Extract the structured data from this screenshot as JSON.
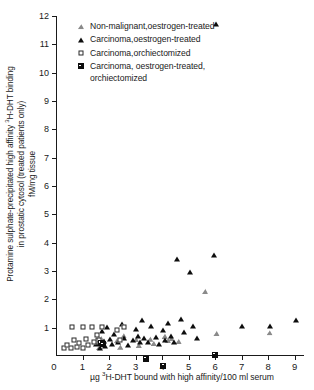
{
  "chart_data": {
    "type": "scatter",
    "title": "",
    "xlabel": "µg ³H-DHT bound with high affinity/100 ml serum",
    "ylabel_lines": [
      "Protamine sulphate-precipitated high affinity ³H-DHT binding",
      "in prostatic cytosol (treated patients only)",
      "fM/mg tissue"
    ],
    "xlim": [
      0,
      9.35
    ],
    "ylim": [
      0,
      12
    ],
    "xticks": [
      1,
      2,
      3,
      4,
      5,
      6,
      7,
      8,
      9
    ],
    "yticks": [
      1,
      2,
      3,
      4,
      5,
      6,
      7,
      8,
      9,
      10,
      11,
      12
    ],
    "origin_label": "0",
    "grid": false,
    "legend_position": "top-center",
    "series": [
      {
        "name": "Non-malignant, oestrogen-treated",
        "marker": "triangle-open",
        "color": "#8a8a8a",
        "points": [
          [
            1.55,
            0.5
          ],
          [
            1.62,
            0.3
          ],
          [
            1.7,
            0.62
          ],
          [
            1.78,
            0.4
          ],
          [
            2.3,
            0.55
          ],
          [
            2.42,
            0.32
          ],
          [
            2.55,
            0.72
          ],
          [
            3.02,
            0.58
          ],
          [
            3.12,
            0.38
          ],
          [
            3.55,
            0.6
          ],
          [
            3.68,
            0.45
          ],
          [
            4.1,
            0.7
          ],
          [
            4.22,
            0.55
          ],
          [
            4.35,
            0.62
          ],
          [
            4.62,
            0.52
          ],
          [
            5.62,
            2.28
          ],
          [
            6.05,
            0.8
          ],
          [
            8.05,
            0.82
          ]
        ]
      },
      {
        "name": "Carcinoma, oestrogen-treated",
        "marker": "triangle-filled",
        "color": "#0d0d0d",
        "points": [
          [
            1.52,
            0.42
          ],
          [
            1.6,
            0.68
          ],
          [
            1.66,
            0.3
          ],
          [
            1.72,
            0.88
          ],
          [
            1.8,
            0.52
          ],
          [
            1.86,
            0.35
          ],
          [
            1.92,
            1.02
          ],
          [
            2.02,
            0.6
          ],
          [
            2.12,
            0.44
          ],
          [
            2.2,
            0.78
          ],
          [
            2.35,
            0.48
          ],
          [
            2.48,
            1.12
          ],
          [
            2.58,
            0.62
          ],
          [
            2.72,
            0.4
          ],
          [
            2.92,
            0.55
          ],
          [
            3.0,
            0.95
          ],
          [
            3.08,
            0.72
          ],
          [
            3.16,
            0.48
          ],
          [
            3.24,
            1.28
          ],
          [
            3.32,
            0.62
          ],
          [
            3.45,
            0.5
          ],
          [
            3.58,
            1.05
          ],
          [
            3.78,
            0.68
          ],
          [
            3.88,
            0.42
          ],
          [
            4.02,
            0.92
          ],
          [
            4.12,
            0.58
          ],
          [
            4.22,
            1.18
          ],
          [
            4.32,
            0.72
          ],
          [
            4.45,
            0.5
          ],
          [
            4.58,
            3.42
          ],
          [
            4.72,
            1.32
          ],
          [
            4.82,
            0.85
          ],
          [
            5.05,
            2.95
          ],
          [
            5.18,
            1.05
          ],
          [
            5.3,
            0.62
          ],
          [
            5.95,
            3.58
          ],
          [
            6.05,
            11.72
          ],
          [
            7.0,
            1.05
          ],
          [
            8.08,
            1.05
          ],
          [
            9.05,
            1.28
          ]
        ]
      },
      {
        "name": "Carcinoma, orchiectomized",
        "marker": "square-open",
        "color": "#2b2b2b",
        "points": [
          [
            0.3,
            0.28
          ],
          [
            0.42,
            0.4
          ],
          [
            0.55,
            0.3
          ],
          [
            0.68,
            0.55
          ],
          [
            0.78,
            0.32
          ],
          [
            0.88,
            0.45
          ],
          [
            1.02,
            0.3
          ],
          [
            1.12,
            0.6
          ],
          [
            1.22,
            0.38
          ],
          [
            1.35,
            1.02
          ],
          [
            1.45,
            0.48
          ],
          [
            1.55,
            0.75
          ],
          [
            1.62,
            0.55
          ],
          [
            1.72,
            1.02
          ],
          [
            0.62,
            1.02
          ],
          [
            1.0,
            1.02
          ],
          [
            2.3,
            0.92
          ],
          [
            2.42,
            0.58
          ],
          [
            2.55,
            1.02
          ]
        ]
      },
      {
        "name": "Carcinoma, oestrogen-treated, orchiectomized",
        "marker": "square-filled",
        "color": "#0d0d0d",
        "points": [
          [
            1.68,
            0.45
          ],
          [
            1.76,
            0.62
          ],
          [
            3.38,
            0.32
          ],
          [
            4.05,
            0.3
          ],
          [
            5.98,
            0.88
          ]
        ]
      }
    ]
  },
  "legend": {
    "items": [
      {
        "marker": "triangle-open",
        "label": "Non-malignant,oestrogen-treated"
      },
      {
        "marker": "triangle-filled",
        "label": "Carcinoma,oestrogen-treated"
      },
      {
        "marker": "square-open",
        "label": "Carcinoma,orchiectomized"
      },
      {
        "marker": "square-filled",
        "label": "Carcinoma, oestrogen-treated,\norchiectomized"
      }
    ]
  }
}
